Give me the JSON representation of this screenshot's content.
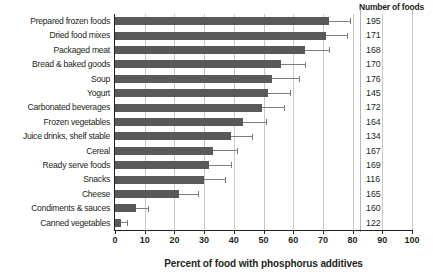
{
  "chart_data": {
    "type": "bar",
    "orientation": "horizontal",
    "title": "",
    "xlabel": "Percent of food with phosphorus additives",
    "ylabel": "",
    "xlim": [
      0,
      100
    ],
    "xticks": [
      0,
      10,
      20,
      30,
      40,
      50,
      60,
      70,
      80,
      90,
      100
    ],
    "grid": true,
    "legend": null,
    "bar_color": "#595959",
    "errorbar_color": "#7d7d7d",
    "extra_column_header": "Number of foods",
    "categories": [
      "Prepared frozen foods",
      "Dried food mixes",
      "Packaged meat",
      "Bread & baked goods",
      "Soup",
      "Yogurt",
      "Carbonated beverages",
      "Frozen vegetables",
      "Juice drinks, shelf stable",
      "Cereal",
      "Ready serve foods",
      "Snacks",
      "Cheese",
      "Condiments & sauces",
      "Canned vegetables"
    ],
    "values": [
      72,
      71,
      64,
      56,
      53,
      51.5,
      49.5,
      43,
      39,
      33,
      31.5,
      30,
      21.5,
      7,
      2
    ],
    "error_high": [
      79,
      78,
      72,
      64,
      62,
      59,
      57,
      51,
      46,
      41,
      39,
      37,
      28,
      11,
      4
    ],
    "number_of_foods": [
      195,
      171,
      168,
      170,
      176,
      145,
      172,
      164,
      134,
      167,
      169,
      116,
      165,
      160,
      122
    ]
  }
}
